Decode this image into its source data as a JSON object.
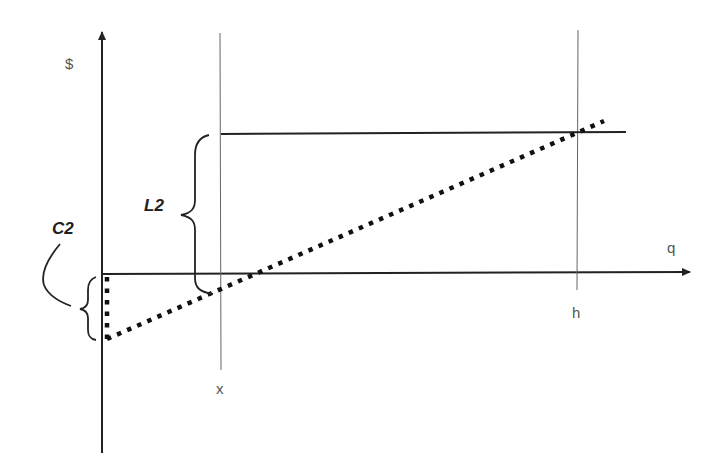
{
  "diagram": {
    "type": "economics-cost-diagram",
    "axes": {
      "y_label": "$",
      "x_label": "q"
    },
    "markers": {
      "x_marker": "x",
      "h_marker": "h"
    },
    "braces": {
      "l2_label": "L2",
      "c2_label": "C2"
    },
    "lines": [
      {
        "name": "horizontal-level",
        "style": "solid",
        "from": [
          220,
          133
        ],
        "to": [
          626,
          133
        ]
      },
      {
        "name": "dotted-cost-line",
        "style": "dotted",
        "from": [
          105,
          339
        ],
        "to": [
          602,
          121
        ]
      },
      {
        "name": "dotted-intercept",
        "style": "dotted",
        "from": [
          106,
          276
        ],
        "to": [
          106,
          339
        ]
      },
      {
        "name": "vertical-x",
        "style": "thin",
        "x": 220
      },
      {
        "name": "vertical-h",
        "style": "thin",
        "x": 578
      }
    ],
    "colors": {
      "line": "#222222",
      "thin_line": "#666666",
      "label": "#555555"
    }
  }
}
